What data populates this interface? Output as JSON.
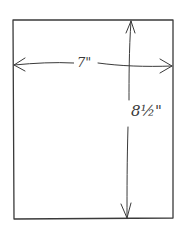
{
  "diagram": {
    "shape": "rectangle",
    "style": "hand-drawn pencil sketch",
    "ink_color": "#3a3a3a",
    "background": "#ffffff",
    "dimensions": {
      "width": {
        "label": "7\"",
        "value_in": 7
      },
      "height": {
        "label": "8½\"",
        "value_in": 8.5
      }
    }
  }
}
